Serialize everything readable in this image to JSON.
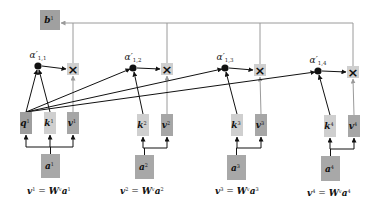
{
  "colors": {
    "background": "#ffffff",
    "query_box": "#9e9e9e",
    "key_box": "#cfcfcf",
    "value_box": "#a6a6a6",
    "input_box": "#a8a8a8",
    "output_box": "#a0a0a0",
    "multiply_box": "#cfcfcf",
    "dark_arrow": "#111111",
    "gray_arrow": "#9a9a9a"
  },
  "output": {
    "label": "b",
    "sup": "1",
    "x": 40,
    "y": 10,
    "w": 20,
    "h": 20
  },
  "top_line_y": 23,
  "columns": [
    {
      "index": 1,
      "alpha": {
        "label": "α′",
        "sub": "1,1",
        "dot_x": 38,
        "dot_y": 66
      },
      "multiply": {
        "symbol": "×",
        "x": 67,
        "y": 63,
        "w": 12,
        "h": 12
      },
      "boxes": [
        {
          "kind": "q",
          "label": "q",
          "sup": "1",
          "x": 20,
          "y": 112,
          "w": 12,
          "h": 22
        },
        {
          "kind": "k",
          "label": "k",
          "sup": "1",
          "x": 44,
          "y": 112,
          "w": 12,
          "h": 22
        },
        {
          "kind": "v",
          "label": "v",
          "sup": "1",
          "x": 67,
          "y": 112,
          "w": 12,
          "h": 22
        }
      ],
      "input": {
        "label": "a",
        "sup": "1",
        "x": 41,
        "y": 154,
        "w": 19,
        "h": 24
      },
      "equation": {
        "lhs": "v",
        "lhs_sup": "1",
        "eq": " = ",
        "w": "W",
        "w_sup": "v",
        "rhs": "a",
        "rhs_sup": "1",
        "x": 27,
        "y": 194
      }
    },
    {
      "index": 2,
      "alpha": {
        "label": "α′",
        "sub": "1,2",
        "dot_x": 133,
        "dot_y": 68
      },
      "multiply": {
        "symbol": "×",
        "x": 161,
        "y": 63,
        "w": 12,
        "h": 12
      },
      "boxes": [
        {
          "kind": "k",
          "label": "k",
          "sup": "2",
          "x": 137,
          "y": 114,
          "w": 12,
          "h": 22
        },
        {
          "kind": "v",
          "label": "v",
          "sup": "2",
          "x": 161,
          "y": 114,
          "w": 12,
          "h": 22
        }
      ],
      "input": {
        "label": "a",
        "sup": "2",
        "x": 135,
        "y": 155,
        "w": 19,
        "h": 24
      },
      "equation": {
        "lhs": "v",
        "lhs_sup": "2",
        "eq": " = ",
        "w": "W",
        "w_sup": "v",
        "rhs": "a",
        "rhs_sup": "2",
        "x": 120,
        "y": 194
      }
    },
    {
      "index": 3,
      "alpha": {
        "label": "α′",
        "sub": "1,3",
        "dot_x": 225,
        "dot_y": 68
      },
      "multiply": {
        "symbol": "×",
        "x": 254,
        "y": 64,
        "w": 12,
        "h": 12
      },
      "boxes": [
        {
          "kind": "k",
          "label": "k",
          "sup": "3",
          "x": 231,
          "y": 114,
          "w": 12,
          "h": 22
        },
        {
          "kind": "v",
          "label": "v",
          "sup": "3",
          "x": 255,
          "y": 114,
          "w": 12,
          "h": 22
        }
      ],
      "input": {
        "label": "a",
        "sup": "3",
        "x": 227,
        "y": 155,
        "w": 19,
        "h": 25
      },
      "equation": {
        "lhs": "v",
        "lhs_sup": "3",
        "eq": " = ",
        "w": "W",
        "w_sup": "v",
        "rhs": "a",
        "rhs_sup": "3",
        "x": 215,
        "y": 194
      }
    },
    {
      "index": 4,
      "alpha": {
        "label": "α′",
        "sub": "1,4",
        "dot_x": 318,
        "dot_y": 71
      },
      "multiply": {
        "symbol": "×",
        "x": 347,
        "y": 66,
        "w": 12,
        "h": 12
      },
      "boxes": [
        {
          "kind": "k",
          "label": "k",
          "sup": "4",
          "x": 324,
          "y": 115,
          "w": 12,
          "h": 22
        },
        {
          "kind": "v",
          "label": "v",
          "sup": "4",
          "x": 348,
          "y": 115,
          "w": 12,
          "h": 22
        }
      ],
      "input": {
        "label": "a",
        "sup": "4",
        "x": 321,
        "y": 156,
        "w": 19,
        "h": 25
      },
      "equation": {
        "lhs": "v",
        "lhs_sup": "4",
        "eq": " = ",
        "w": "W",
        "w_sup": "v",
        "rhs": "a",
        "rhs_sup": "4",
        "x": 307,
        "y": 196
      }
    }
  ]
}
